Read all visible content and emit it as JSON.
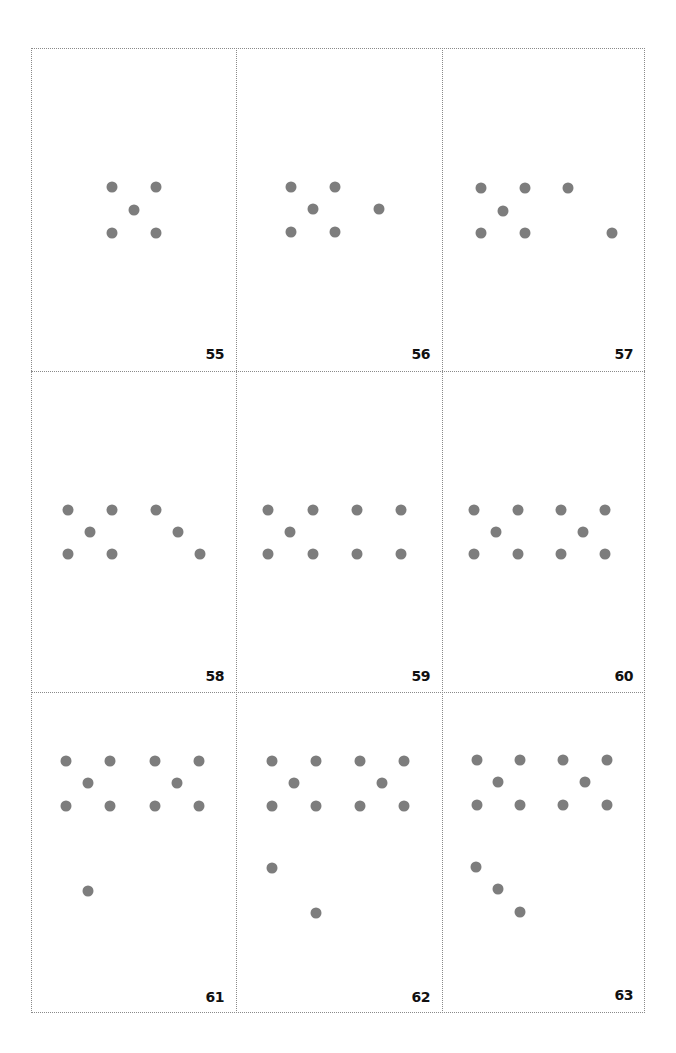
{
  "document": {
    "type": "dot-pattern card sheet",
    "dot_color": "#7d7d7d",
    "border_color": "#8a8a8a",
    "grid": {
      "columns": 3,
      "rows": 3
    },
    "cards": [
      {
        "number": "55",
        "dots": [
          [
            112,
            187
          ],
          [
            156,
            187
          ],
          [
            134,
            210
          ],
          [
            112,
            233
          ],
          [
            156,
            233
          ]
        ]
      },
      {
        "number": "56",
        "dots": [
          [
            291,
            187
          ],
          [
            335,
            187
          ],
          [
            313,
            209
          ],
          [
            379,
            209
          ],
          [
            291,
            232
          ],
          [
            335,
            232
          ]
        ]
      },
      {
        "number": "57",
        "dots": [
          [
            481,
            188
          ],
          [
            525,
            188
          ],
          [
            568,
            188
          ],
          [
            503,
            211
          ],
          [
            481,
            233
          ],
          [
            525,
            233
          ],
          [
            612,
            233
          ]
        ]
      },
      {
        "number": "58",
        "dots": [
          [
            68,
            510
          ],
          [
            112,
            510
          ],
          [
            156,
            510
          ],
          [
            90,
            532
          ],
          [
            178,
            532
          ],
          [
            68,
            554
          ],
          [
            112,
            554
          ],
          [
            200,
            554
          ]
        ]
      },
      {
        "number": "59",
        "dots": [
          [
            268,
            510
          ],
          [
            313,
            510
          ],
          [
            357,
            510
          ],
          [
            401,
            510
          ],
          [
            290,
            532
          ],
          [
            268,
            554
          ],
          [
            313,
            554
          ],
          [
            357,
            554
          ],
          [
            401,
            554
          ]
        ]
      },
      {
        "number": "60",
        "dots": [
          [
            474,
            510
          ],
          [
            518,
            510
          ],
          [
            561,
            510
          ],
          [
            605,
            510
          ],
          [
            496,
            532
          ],
          [
            583,
            532
          ],
          [
            474,
            554
          ],
          [
            518,
            554
          ],
          [
            561,
            554
          ],
          [
            605,
            554
          ]
        ]
      },
      {
        "number": "61",
        "dots": [
          [
            66,
            761
          ],
          [
            110,
            761
          ],
          [
            155,
            761
          ],
          [
            199,
            761
          ],
          [
            88,
            783
          ],
          [
            177,
            783
          ],
          [
            66,
            806
          ],
          [
            110,
            806
          ],
          [
            155,
            806
          ],
          [
            199,
            806
          ],
          [
            88,
            891
          ]
        ]
      },
      {
        "number": "62",
        "dots": [
          [
            272,
            761
          ],
          [
            316,
            761
          ],
          [
            360,
            761
          ],
          [
            404,
            761
          ],
          [
            294,
            783
          ],
          [
            382,
            783
          ],
          [
            272,
            806
          ],
          [
            316,
            806
          ],
          [
            360,
            806
          ],
          [
            404,
            806
          ],
          [
            272,
            868
          ],
          [
            316,
            913
          ]
        ]
      },
      {
        "number": "63",
        "dots": [
          [
            477,
            760
          ],
          [
            520,
            760
          ],
          [
            563,
            760
          ],
          [
            607,
            760
          ],
          [
            498,
            782
          ],
          [
            585,
            782
          ],
          [
            477,
            805
          ],
          [
            520,
            805
          ],
          [
            563,
            805
          ],
          [
            607,
            805
          ],
          [
            476,
            867
          ],
          [
            498,
            889
          ],
          [
            520,
            912
          ]
        ]
      }
    ]
  }
}
